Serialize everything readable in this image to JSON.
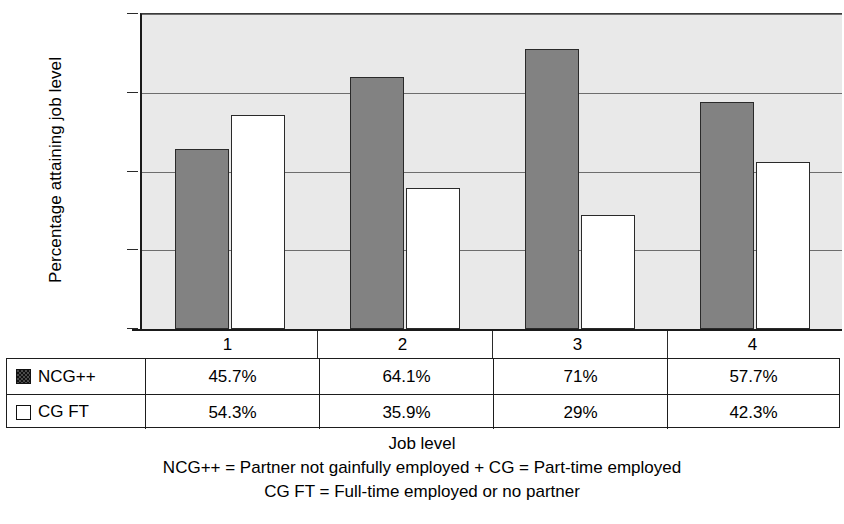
{
  "chart_data": {
    "type": "bar",
    "title": "",
    "xlabel": "Job level",
    "ylabel": "Percentage attaining job level",
    "categories": [
      "1",
      "2",
      "3",
      "4"
    ],
    "ylim": [
      0,
      80
    ],
    "yticks": [
      0,
      20,
      40,
      60,
      80
    ],
    "ytick_labels": [
      "0",
      "20",
      "40",
      "60",
      "80"
    ],
    "grid": true,
    "legend_position": "table-below",
    "series": [
      {
        "name": "NCG++",
        "color": "#828282",
        "swatch": "dark-hatched-square",
        "values": [
          45.7,
          64.1,
          71,
          57.7
        ],
        "labels": [
          "45.7%",
          "64.1%",
          "71%",
          "57.7%"
        ]
      },
      {
        "name": "CG FT",
        "color": "#ffffff",
        "swatch": "white-square",
        "values": [
          54.3,
          35.9,
          29,
          42.3
        ],
        "labels": [
          "54.3%",
          "35.9%",
          "29%",
          "42.3%"
        ]
      }
    ],
    "annotations": [
      "NCG++ = Partner not gainfully employed + CG = Part-time employed",
      "CG FT = Full-time employed or no partner"
    ]
  },
  "axis": {
    "y_title": "Percentage attaining job level",
    "y_tick_labels": [
      "80",
      "60",
      "40",
      "20",
      "0"
    ],
    "x_tick_labels": [
      "1",
      "2",
      "3",
      "4"
    ]
  },
  "table": {
    "rows": [
      {
        "legend": "NCG++",
        "swatch": "dark-hatched-square",
        "cells": [
          "45.7%",
          "64.1%",
          "71%",
          "57.7%"
        ]
      },
      {
        "legend": "CG FT",
        "swatch": "white-square",
        "cells": [
          "54.3%",
          "35.9%",
          "29%",
          "42.3%"
        ]
      }
    ]
  },
  "caption": {
    "line1": "Job level",
    "line2": "NCG++ = Partner not gainfully employed + CG = Part-time employed",
    "line3": "CG FT = Full-time employed or no partner"
  },
  "colors": {
    "plot_background": "#e9e9e9",
    "series_dark": "#828282",
    "series_light": "#ffffff",
    "axis": "#1a1a1a",
    "gridline": "#6d6d6d"
  }
}
